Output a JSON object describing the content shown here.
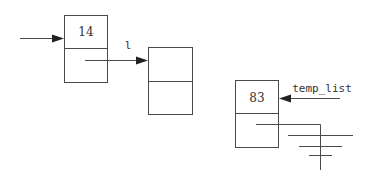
{
  "diagram": {
    "type": "linked-list",
    "nodes": [
      {
        "id": "node1",
        "value": "14",
        "x": 64,
        "y": 15,
        "w": 43,
        "h": 67
      },
      {
        "id": "node2",
        "value": "",
        "x": 148,
        "y": 47,
        "w": 44,
        "h": 67
      },
      {
        "id": "node3",
        "value": "83",
        "x": 235,
        "y": 80,
        "w": 43,
        "h": 67
      }
    ],
    "pointers": [
      {
        "id": "head-pointer",
        "label": "",
        "from": [
          20,
          38
        ],
        "to": [
          64,
          38
        ]
      },
      {
        "id": "l-pointer",
        "label": "l",
        "from": [
          85,
          60
        ],
        "to": [
          148,
          60
        ]
      },
      {
        "id": "temp-list-pointer",
        "label": "temp_list",
        "from": [
          340,
          98
        ],
        "to": [
          278,
          98
        ]
      }
    ],
    "ground": {
      "description": "null pointer to ground symbol"
    }
  }
}
